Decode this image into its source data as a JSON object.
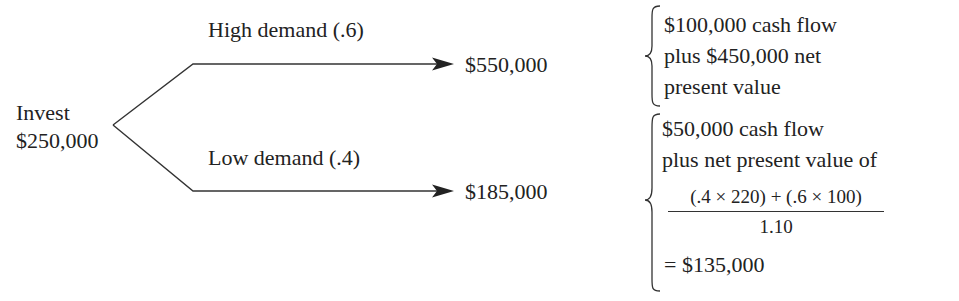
{
  "root": {
    "label_line1": "Invest",
    "label_line2": "$250,000"
  },
  "branches": [
    {
      "label": "High demand (.6)",
      "outcome": "$550,000",
      "explanation": {
        "lines": [
          "$100,000 cash flow",
          "plus $450,000 net",
          "present value"
        ]
      }
    },
    {
      "label": "Low demand (.4)",
      "outcome": "$185,000",
      "explanation": {
        "lines": [
          "$50,000 cash flow",
          "plus net present value of"
        ],
        "fraction": {
          "numerator": "(.4 × 220) + (.6 × 100)",
          "denominator": "1.10"
        },
        "result": "= $135,000"
      }
    }
  ],
  "colors": {
    "line": "#333333",
    "text": "#222222",
    "background": "#ffffff"
  }
}
